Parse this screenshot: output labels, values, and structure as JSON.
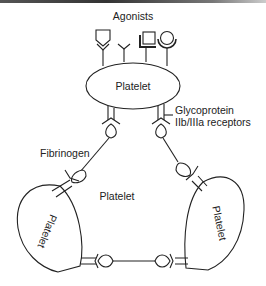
{
  "diagram": {
    "labels": {
      "agonists": "Agonists",
      "platelet_top": "Platelet",
      "platelet_center": "Platelet",
      "platelet_left": "Platelet",
      "platelet_right": "Platelet",
      "gp_line1": "Glycoprotein",
      "gp_line2": "IIb/IIIa receptors",
      "fibrinogen": "Fibrinogen"
    },
    "agonist_receptors": [
      "pentagon-shield",
      "y-shaped",
      "square",
      "circle"
    ],
    "colors": {
      "stroke": "#222222",
      "background": "#ffffff"
    }
  }
}
